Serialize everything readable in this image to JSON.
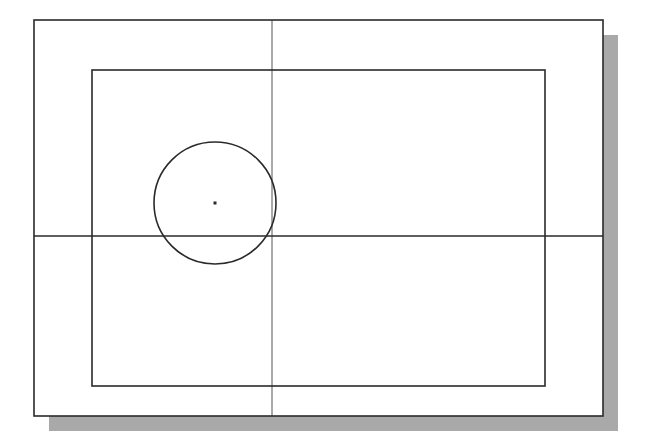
{
  "drawing": {
    "background": "#ffffff",
    "line_color": "#2a2a2a",
    "shadow_color": "#a9a9a9",
    "sheet": {
      "x": 34,
      "y": 20,
      "width": 569,
      "height": 396,
      "stroke_width": 1.6
    },
    "shadow": {
      "offset_x": 15,
      "offset_y": 15
    },
    "border_rect": {
      "x": 92,
      "y": 70,
      "width": 453,
      "height": 316,
      "stroke_width": 1.6
    },
    "vertical_line": {
      "x": 272,
      "y1": 20,
      "y2": 416,
      "stroke_width": 0.8
    },
    "horizontal_line": {
      "y": 236,
      "x1": 34,
      "x2": 603,
      "stroke_width": 1.6
    },
    "circle": {
      "cx": 215,
      "cy": 203,
      "r": 61,
      "stroke_width": 1.6
    },
    "center_point": {
      "cx": 215,
      "cy": 203,
      "size": 3
    }
  }
}
